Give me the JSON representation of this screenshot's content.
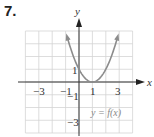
{
  "problem_number": "7.",
  "chart_data": {
    "type": "line",
    "title": "",
    "function_label": "y = f(x)",
    "xlabel": "x",
    "ylabel": "y",
    "xlim": [
      -4,
      4
    ],
    "ylim": [
      -4,
      4
    ],
    "grid": true,
    "x_ticks": [
      -3,
      -1,
      1,
      3
    ],
    "y_ticks": [
      1,
      -1,
      -3
    ],
    "series": [
      {
        "name": "y = f(x)",
        "equation": "(x-1)^2",
        "x": [
          -1,
          -0.5,
          0,
          0.5,
          1,
          1.5,
          2,
          2.5,
          3
        ],
        "y": [
          4,
          2.25,
          1,
          0.25,
          0,
          0.25,
          1,
          2.25,
          4
        ],
        "arrows_at_ends": true,
        "color": "#8c8c8c"
      }
    ]
  },
  "labels": {
    "x_axis": "x",
    "y_axis": "y",
    "tick_neg3_x": "−3",
    "tick_neg1_x": "−1",
    "tick_1_x": "1",
    "tick_3_x": "3",
    "tick_1_y": "1",
    "tick_neg1_y": "−1",
    "tick_neg3_y": "−3",
    "curve_label": "y = f(x)"
  }
}
